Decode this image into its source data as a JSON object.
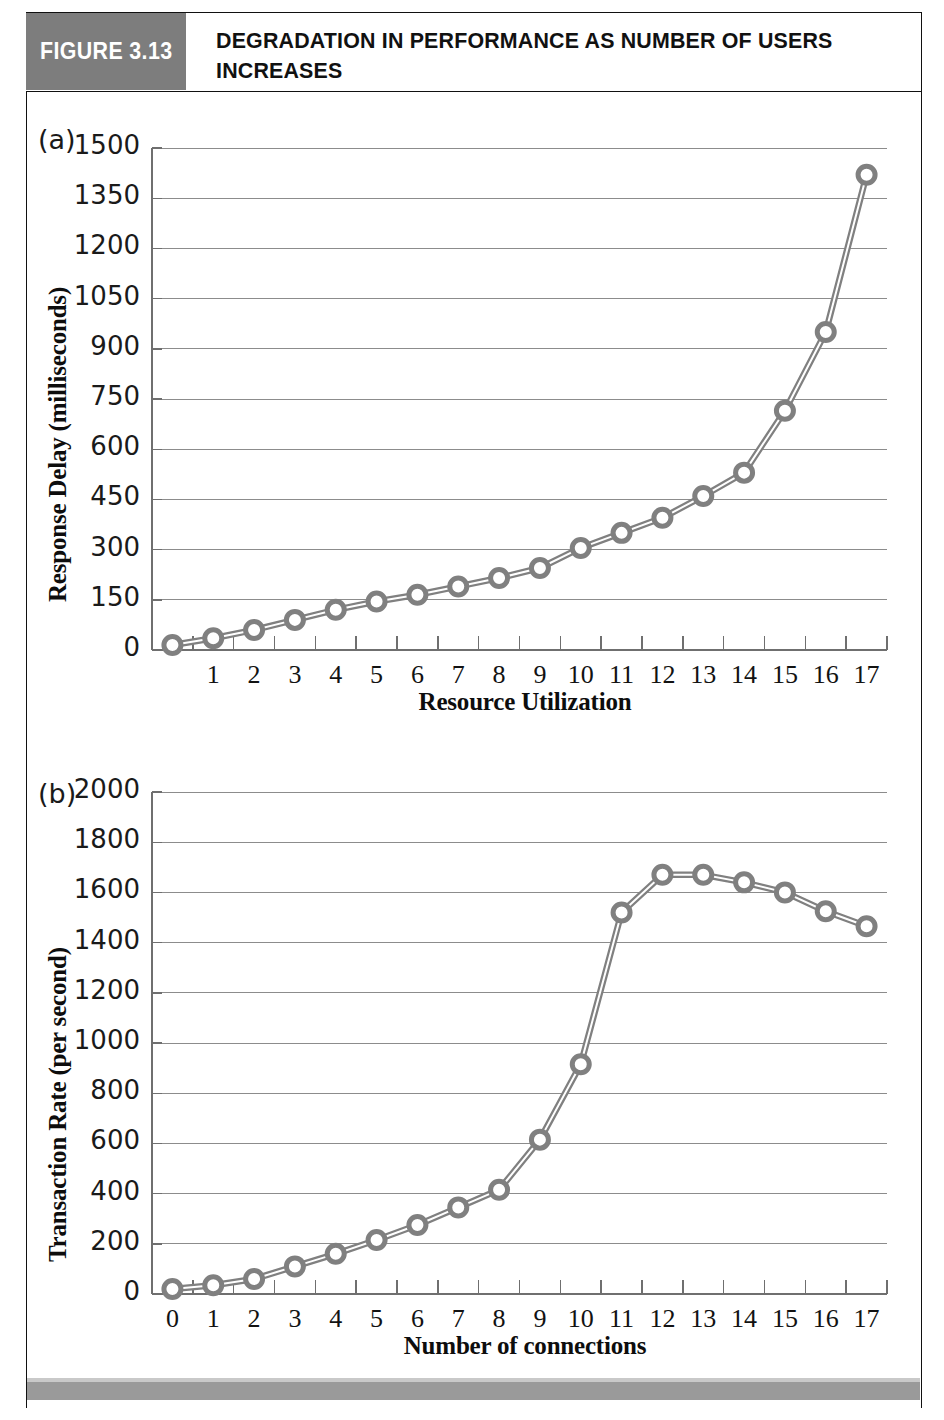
{
  "figure": {
    "badge_label": "FIGURE 3.13",
    "title": "DEGRADATION IN PERFORMANCE AS NUMBER OF USERS INCREASES",
    "badge_color": "#7d7d7d",
    "series_color": "#808080",
    "gridline_color": "#8c8c8c"
  },
  "panels": {
    "a": {
      "tag": "(a)"
    },
    "b": {
      "tag": "(b)"
    }
  },
  "chart_data": [
    {
      "type": "line",
      "panel": "(a)",
      "title": "",
      "xlabel": "Resource Utilization",
      "ylabel": "Response Delay (milliseconds)",
      "xlim": [
        0,
        17.6
      ],
      "ylim": [
        0,
        1500
      ],
      "grid": true,
      "legend": "none",
      "xticklabels": [
        "1",
        "2",
        "3",
        "4",
        "5",
        "6",
        "7",
        "8",
        "9",
        "10",
        "11",
        "12",
        "13",
        "14",
        "15",
        "16",
        "17"
      ],
      "yticklabels": [
        "0",
        "150",
        "300",
        "450",
        "600",
        "750",
        "900",
        "1050",
        "1200",
        "1350",
        "1500"
      ],
      "ytickvalues": [
        0,
        150,
        300,
        450,
        600,
        750,
        900,
        1050,
        1200,
        1350,
        1500
      ],
      "x": [
        0,
        1,
        2,
        3,
        4,
        5,
        6,
        7,
        8,
        9,
        10,
        11,
        12,
        13,
        14,
        15,
        16,
        17
      ],
      "values": [
        15,
        35,
        60,
        90,
        120,
        145,
        165,
        190,
        215,
        245,
        305,
        350,
        395,
        460,
        530,
        715,
        950,
        1420
      ]
    },
    {
      "type": "line",
      "panel": "(b)",
      "title": "",
      "xlabel": "Number of connections",
      "ylabel": "Transaction Rate (per second)",
      "xlim": [
        0,
        17.6
      ],
      "ylim": [
        0,
        2000
      ],
      "grid": true,
      "legend": "none",
      "xticklabels": [
        "0",
        "1",
        "2",
        "3",
        "4",
        "5",
        "6",
        "7",
        "8",
        "9",
        "10",
        "11",
        "12",
        "13",
        "14",
        "15",
        "16",
        "17"
      ],
      "yticklabels": [
        "0",
        "200",
        "400",
        "600",
        "800",
        "1000",
        "1200",
        "1400",
        "1600",
        "1800",
        "2000"
      ],
      "ytickvalues": [
        0,
        200,
        400,
        600,
        800,
        1000,
        1200,
        1400,
        1600,
        1800,
        2000
      ],
      "x": [
        0,
        1,
        2,
        3,
        4,
        5,
        6,
        7,
        8,
        9,
        10,
        11,
        12,
        13,
        14,
        15,
        16,
        17
      ],
      "values": [
        20,
        35,
        60,
        110,
        160,
        215,
        275,
        345,
        415,
        615,
        915,
        1520,
        1670,
        1670,
        1640,
        1600,
        1525,
        1465
      ]
    }
  ]
}
